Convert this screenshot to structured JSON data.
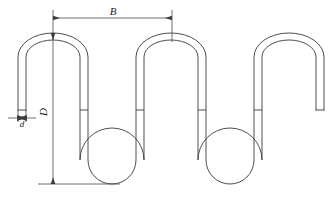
{
  "drawing": {
    "title": "serpentine wire spring dimensioned drawing",
    "type": "technical-line-drawing",
    "line_color": "#3a3a3a",
    "dimension_color": "#4a4a4a",
    "background": "#ffffff"
  },
  "dimensions": [
    {
      "id": "B",
      "label": "B",
      "orientation": "horizontal",
      "meaning": "pitch between adjacent top arch crests",
      "from_x": 53,
      "to_x": 172,
      "line_y": 18,
      "length_px": 119
    },
    {
      "id": "D",
      "label": "D",
      "orientation": "vertical",
      "rotated": true,
      "meaning": "overall height from top arch crest to bottom loop base",
      "from_y": 33,
      "to_y": 184,
      "line_x": 53,
      "length_px": 151
    },
    {
      "id": "d",
      "label": "d",
      "orientation": "horizontal",
      "meaning": "wire diameter / stock thickness",
      "from_x": 18,
      "to_x": 26,
      "line_y": 118,
      "length_px": 8
    }
  ],
  "geometry": {
    "wire_thickness_px": 8,
    "top_arch_centers_x": [
      53,
      172,
      290
    ],
    "bottom_loop_centers_x": [
      112,
      231
    ],
    "top_crest_y": 33,
    "bottom_base_y": 184,
    "free_end_y": 110,
    "left_free_end_x": [
      18,
      26
    ],
    "right_free_end_x": [
      310,
      318
    ],
    "joint_tick_y": 110,
    "joint_tick_count": 4
  }
}
